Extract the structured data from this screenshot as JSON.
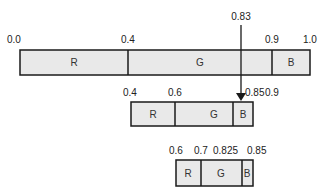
{
  "diagram": {
    "type": "arithmetic-coding-interval-refinement",
    "pointer": {
      "label": "0.83",
      "value": 0.83
    },
    "bars": [
      {
        "name": "level-1",
        "range": [
          0.0,
          1.0
        ],
        "tick_labels": [
          "0.0",
          "0.4",
          "0.9",
          "1.0"
        ],
        "segments": [
          {
            "symbol": "R",
            "from": "0.0",
            "to": "0.4"
          },
          {
            "symbol": "G",
            "from": "0.4",
            "to": "0.9"
          },
          {
            "symbol": "B",
            "from": "0.9",
            "to": "1.0"
          }
        ]
      },
      {
        "name": "level-2",
        "range": [
          0.4,
          0.9
        ],
        "tick_labels": [
          "0.4",
          "0.6",
          "0.85",
          "0.9"
        ],
        "segments": [
          {
            "symbol": "R",
            "from": "0.4",
            "to": "0.6"
          },
          {
            "symbol": "G",
            "from": "0.6",
            "to": "0.85"
          },
          {
            "symbol": "B",
            "from": "0.85",
            "to": "0.9"
          }
        ]
      },
      {
        "name": "level-3",
        "range": [
          0.6,
          0.85
        ],
        "tick_labels": [
          "0.6",
          "0.7",
          "0.825",
          "0.85"
        ],
        "segments": [
          {
            "symbol": "R",
            "from": "0.6",
            "to": "0.7"
          },
          {
            "symbol": "G",
            "from": "0.7",
            "to": "0.825"
          },
          {
            "symbol": "B",
            "from": "0.825",
            "to": "0.85"
          }
        ]
      }
    ]
  },
  "colors": {
    "segment_fill": "#e9e9e9",
    "stroke": "#1a1a1a",
    "text": "#222222"
  }
}
